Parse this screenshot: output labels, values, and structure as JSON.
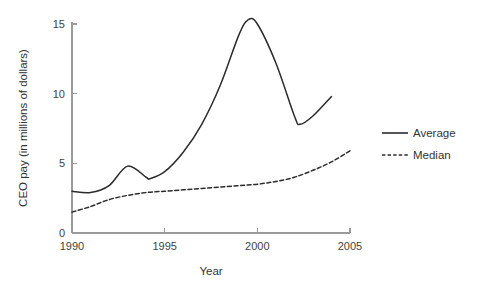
{
  "chart_data": {
    "type": "line",
    "title": "",
    "xlabel": "Year",
    "ylabel": "CEO pay (in millions of dollars)",
    "xlim": [
      1990,
      2005
    ],
    "ylim": [
      0,
      16
    ],
    "xticks": [
      1990,
      1995,
      2000,
      2005
    ],
    "yticks": [
      0,
      5,
      10,
      15
    ],
    "xtick_labels": [
      "1990",
      "1995",
      "2000",
      "2005"
    ],
    "ytick_labels": [
      "0",
      "5",
      "10",
      "15"
    ],
    "grid": false,
    "legend_position": "right",
    "series": [
      {
        "name": "Average",
        "style": "solid",
        "color": "#2b2b2b",
        "x": [
          1990,
          1991,
          1992,
          1993,
          1994,
          1994.2,
          1995,
          1996,
          1997,
          1998,
          1999,
          1999.5,
          2000,
          2001,
          2002,
          2002.3,
          2003,
          2004
        ],
        "values": [
          3.0,
          2.9,
          3.4,
          4.8,
          4.0,
          3.9,
          4.4,
          5.8,
          7.8,
          10.6,
          14.2,
          15.3,
          15.0,
          12.2,
          8.4,
          7.8,
          8.4,
          9.8
        ]
      },
      {
        "name": "Median",
        "style": "dashed",
        "color": "#2b2b2b",
        "x": [
          1990,
          1991,
          1992,
          1993,
          1994,
          1995,
          1996,
          1997,
          1998,
          1999,
          2000,
          2001,
          2002,
          2003,
          2004,
          2005
        ],
        "values": [
          1.5,
          1.9,
          2.4,
          2.7,
          2.9,
          3.0,
          3.1,
          3.2,
          3.3,
          3.4,
          3.5,
          3.7,
          4.0,
          4.5,
          5.1,
          5.9
        ]
      }
    ]
  },
  "legend": {
    "items": [
      {
        "label": "Average",
        "style": "solid"
      },
      {
        "label": "Median",
        "style": "dashed"
      }
    ]
  },
  "colors": {
    "line": "#2b2b2b",
    "axis": "#9a9a9a",
    "text": "#333333",
    "background": "#ffffff"
  }
}
